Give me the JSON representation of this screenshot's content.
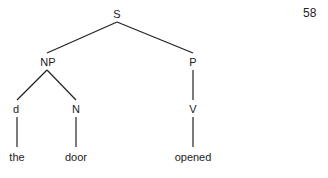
{
  "page_number": "58",
  "tree": {
    "nodes": [
      {
        "id": "S",
        "label": "S",
        "x": 117,
        "y": 14
      },
      {
        "id": "NP",
        "label": "NP",
        "x": 48,
        "y": 62
      },
      {
        "id": "P",
        "label": "P",
        "x": 193,
        "y": 62
      },
      {
        "id": "d",
        "label": "d",
        "x": 16,
        "y": 109
      },
      {
        "id": "N",
        "label": "N",
        "x": 76,
        "y": 109
      },
      {
        "id": "V",
        "label": "V",
        "x": 193,
        "y": 109
      },
      {
        "id": "the",
        "label": "the",
        "x": 17,
        "y": 157
      },
      {
        "id": "door",
        "label": "door",
        "x": 76,
        "y": 157
      },
      {
        "id": "opened",
        "label": "opened",
        "x": 193,
        "y": 157
      }
    ],
    "edges": [
      {
        "from": "S",
        "to": "NP",
        "x1": 117,
        "y1": 22,
        "x2": 47,
        "y2": 53
      },
      {
        "from": "S",
        "to": "P",
        "x1": 117,
        "y1": 22,
        "x2": 193,
        "y2": 53
      },
      {
        "from": "NP",
        "to": "d",
        "x1": 47,
        "y1": 70,
        "x2": 17,
        "y2": 100
      },
      {
        "from": "NP",
        "to": "N",
        "x1": 47,
        "y1": 70,
        "x2": 76,
        "y2": 100
      },
      {
        "from": "P",
        "to": "V",
        "x1": 193,
        "y1": 70,
        "x2": 193,
        "y2": 100
      },
      {
        "from": "d",
        "to": "the",
        "x1": 17,
        "y1": 117,
        "x2": 17,
        "y2": 147
      },
      {
        "from": "N",
        "to": "door",
        "x1": 76,
        "y1": 117,
        "x2": 76,
        "y2": 147
      },
      {
        "from": "V",
        "to": "opened",
        "x1": 193,
        "y1": 117,
        "x2": 193,
        "y2": 147
      }
    ]
  }
}
